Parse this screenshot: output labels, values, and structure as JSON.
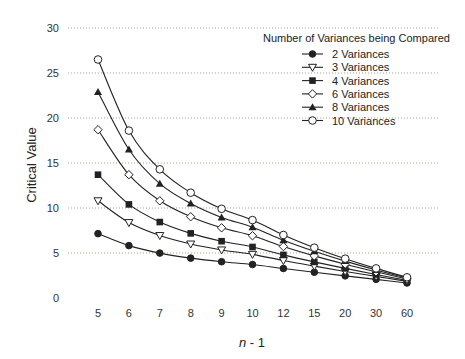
{
  "chart_data": {
    "type": "line",
    "title": "",
    "xlabel": "n - 1",
    "xlabel_italic_part": "n",
    "xlabel_rest": " - 1",
    "ylabel": "Critical Value",
    "ylim": [
      0,
      30
    ],
    "yticks": [
      0,
      5,
      10,
      15,
      20,
      25,
      30
    ],
    "grid": "horizontal dotted",
    "categories": [
      "5",
      "6",
      "7",
      "8",
      "9",
      "10",
      "12",
      "15",
      "20",
      "30",
      "60"
    ],
    "legend": {
      "title": "Number of Variances being Compared",
      "position": "upper right"
    },
    "series": [
      {
        "name": "2 Variances",
        "marker": "filled-circle",
        "values": [
          7.15,
          5.82,
          4.99,
          4.43,
          4.03,
          3.72,
          3.28,
          2.86,
          2.46,
          2.07,
          1.67
        ]
      },
      {
        "name": "3 Variances",
        "marker": "open-triangle-down",
        "values": [
          10.8,
          8.38,
          6.94,
          6.0,
          5.34,
          4.85,
          4.16,
          3.54,
          2.95,
          2.4,
          1.85
        ]
      },
      {
        "name": "4 Variances",
        "marker": "filled-square",
        "values": [
          13.7,
          10.4,
          8.44,
          7.18,
          6.31,
          5.67,
          4.79,
          4.01,
          3.29,
          2.61,
          1.96
        ]
      },
      {
        "name": "6 Variances",
        "marker": "open-diamond",
        "values": [
          18.7,
          13.7,
          10.8,
          9.03,
          7.8,
          6.92,
          5.72,
          4.68,
          3.76,
          2.91,
          2.11
        ]
      },
      {
        "name": "8 Variances",
        "marker": "filled-triangle-up",
        "values": [
          22.9,
          16.5,
          12.7,
          10.5,
          8.95,
          7.87,
          6.42,
          5.19,
          4.1,
          3.12,
          2.22
        ]
      },
      {
        "name": "10 Variances",
        "marker": "open-circle",
        "values": [
          26.5,
          18.6,
          14.3,
          11.7,
          9.91,
          8.66,
          7.0,
          5.59,
          4.37,
          3.29,
          2.3
        ]
      }
    ]
  },
  "colors": {
    "line": "#222222",
    "grid": "#b89a8a",
    "tick_text": "#333333"
  }
}
